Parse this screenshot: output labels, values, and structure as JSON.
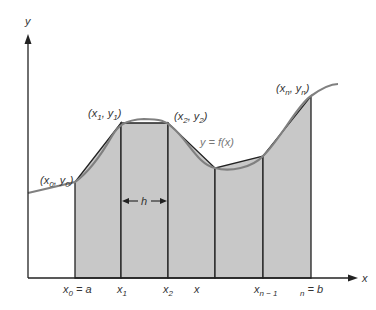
{
  "figure": {
    "colors": {
      "background": "#ffffff",
      "trapezoid_fill": "#c8c8c8",
      "trapezoid_stroke": "#222222",
      "curve": "#808080",
      "axis": "#222222",
      "text": "#333333"
    },
    "axes": {
      "x_label": "x",
      "y_label": "y"
    },
    "curve_label": "y = f(x)",
    "width_label": "h",
    "points": [
      {
        "name": "P0",
        "label_main": "x",
        "label_sub": "0",
        "label_main2": "y",
        "label_sub2": "0"
      },
      {
        "name": "P1",
        "label_main": "x",
        "label_sub": "1",
        "label_main2": "y",
        "label_sub2": "1"
      },
      {
        "name": "P2",
        "label_main": "x",
        "label_sub": "2",
        "label_main2": "y",
        "label_sub2": "2"
      },
      {
        "name": "Pn",
        "label_main": "x",
        "label_sub": "n",
        "label_main2": "y",
        "label_sub2": "n"
      }
    ],
    "x_ticks": [
      {
        "main": "x",
        "sub": "0",
        "suffix": " = a"
      },
      {
        "main": "x",
        "sub": "1",
        "suffix": ""
      },
      {
        "main": "x",
        "sub": "2",
        "suffix": ""
      },
      {
        "main": "x",
        "sub": "",
        "suffix": ""
      },
      {
        "main": "x",
        "sub": "n − 1",
        "suffix": ""
      },
      {
        "main": "",
        "sub": "n",
        "suffix": " = b"
      }
    ]
  }
}
